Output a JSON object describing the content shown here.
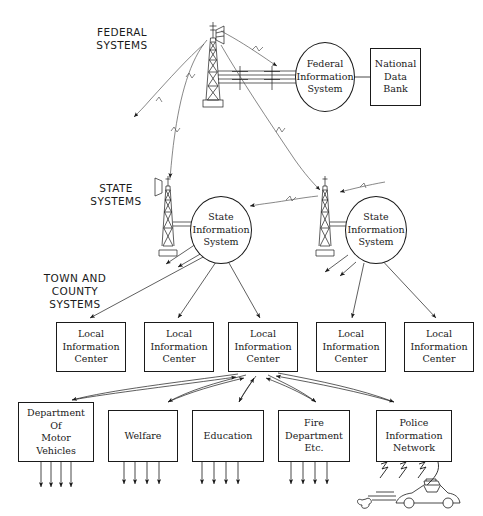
{
  "figure": {
    "caption": "",
    "line_color": "#1a1a1a",
    "background_color": "#ffffff"
  },
  "tiers": [
    {
      "id": "federal",
      "label": "FEDERAL\nSYSTEMS"
    },
    {
      "id": "state",
      "label": "STATE\nSYSTEMS"
    },
    {
      "id": "town_county",
      "label": "TOWN AND\nCOUNTY\nSYSTEMS"
    }
  ],
  "federal_tier": {
    "tower_name": "federal-radio-tower",
    "information_system": "Federal\nInformation\nSystem",
    "data_bank": "National\nData\nBank"
  },
  "state_tier": {
    "towers": [
      {
        "name": "state-radio-tower-left"
      },
      {
        "name": "state-radio-tower-right"
      }
    ],
    "systems": [
      {
        "label": "State\nInformation\nSystem"
      },
      {
        "label": "State\nInformation\nSystem"
      }
    ]
  },
  "local_tier": {
    "centers": [
      {
        "label": "Local\nInformation\nCenter"
      },
      {
        "label": "Local\nInformation\nCenter"
      },
      {
        "label": "Local\nInformation\nCenter"
      },
      {
        "label": "Local\nInformation\nCenter"
      },
      {
        "label": "Local\nInformation\nCenter"
      }
    ]
  },
  "department_tier": {
    "departments": [
      {
        "label": "Department\nOf\nMotor\nVehicles"
      },
      {
        "label": "Welfare"
      },
      {
        "label": "Education"
      },
      {
        "label": "Fire\nDepartment\nEtc."
      },
      {
        "label": "Police\nInformation\nNetwork"
      }
    ],
    "vehicle": "police-car-illustration"
  }
}
